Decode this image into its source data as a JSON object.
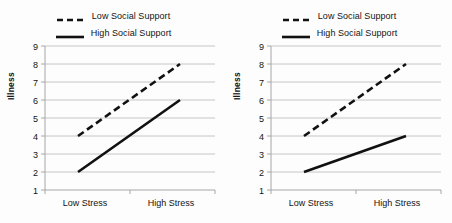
{
  "figure": {
    "background_color": "#fdfdfd",
    "line_color": "#111111",
    "grid_color": "#bfbfbf",
    "axis_color": "#a6a6a6"
  },
  "panels": [
    {
      "name": "left-panel",
      "legend": {
        "entries": [
          {
            "label": "Low Social Support",
            "style": "dashed",
            "swatch": "dashed-line-swatch"
          },
          {
            "label": "High Social Support",
            "style": "solid",
            "swatch": "solid-line-swatch"
          }
        ]
      },
      "chart_data": {
        "type": "line",
        "title": "",
        "xlabel": "",
        "ylabel": "Illness",
        "categories": [
          "Low Stress",
          "High Stress"
        ],
        "x_tick_labels": [
          "Low Stress",
          "High Stress"
        ],
        "y_tick_labels": [
          "1",
          "2",
          "3",
          "4",
          "5",
          "6",
          "7",
          "8",
          "9"
        ],
        "ylim": [
          1,
          9
        ],
        "grid": true,
        "legend_position": "top-center",
        "series": [
          {
            "name": "Low Social Support",
            "style": "dashed",
            "values": [
              4,
              8
            ]
          },
          {
            "name": "High Social Support",
            "style": "solid",
            "values": [
              2,
              6
            ]
          }
        ]
      }
    },
    {
      "name": "right-panel",
      "legend": {
        "entries": [
          {
            "label": "Low Social Support",
            "style": "dashed",
            "swatch": "dashed-line-swatch"
          },
          {
            "label": "High Social Support",
            "style": "solid",
            "swatch": "solid-line-swatch"
          }
        ]
      },
      "chart_data": {
        "type": "line",
        "title": "",
        "xlabel": "",
        "ylabel": "Illness",
        "categories": [
          "Low Stress",
          "High Stress"
        ],
        "x_tick_labels": [
          "Low Stress",
          "High Stress"
        ],
        "y_tick_labels": [
          "1",
          "2",
          "3",
          "4",
          "5",
          "6",
          "7",
          "8",
          "9"
        ],
        "ylim": [
          1,
          9
        ],
        "grid": true,
        "legend_position": "top-center",
        "series": [
          {
            "name": "Low Social Support",
            "style": "dashed",
            "values": [
              4,
              8
            ]
          },
          {
            "name": "High Social Support",
            "style": "solid",
            "values": [
              2,
              4
            ]
          }
        ]
      }
    }
  ]
}
